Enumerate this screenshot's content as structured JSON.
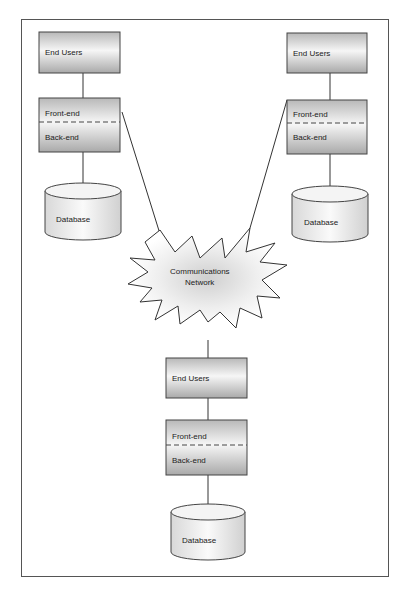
{
  "diagram": {
    "title": "",
    "nodes": [
      {
        "id": "site-left",
        "end_users": "End Users",
        "front_end": "Front-end",
        "back_end": "Back-end",
        "database": "Database"
      },
      {
        "id": "site-right",
        "end_users": "End Users",
        "front_end": "Front-end",
        "back_end": "Back-end",
        "database": "Database"
      },
      {
        "id": "site-bottom",
        "end_users": "End Users",
        "front_end": "Front-end",
        "back_end": "Back-end",
        "database": "Database"
      }
    ],
    "network": {
      "line1": "Communications",
      "line2": "Network"
    },
    "colors": {
      "box_top": "#bdbdbd",
      "box_mid": "#f4f4f4",
      "box_bottom": "#b0b0b0",
      "stroke": "#444444",
      "cloud_center": "#d0d0d0"
    }
  }
}
